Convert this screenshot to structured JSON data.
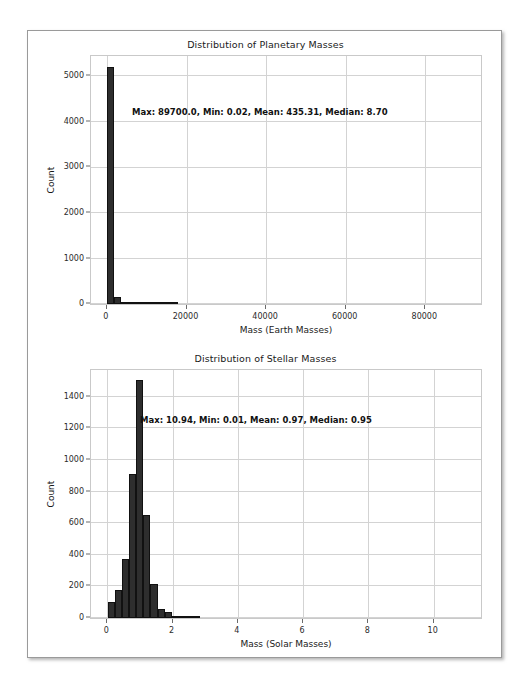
{
  "page": {
    "background": "#ffffff",
    "frame_border_color": "#9a9a9a"
  },
  "chart_data": [
    {
      "id": "planetary",
      "type": "bar",
      "title": "Distribution of Planetary Masses",
      "xlabel": "Mass (Earth Masses)",
      "ylabel": "Count",
      "xlim": [
        -4000,
        94000
      ],
      "ylim": [
        0,
        5450
      ],
      "xticks": [
        0,
        20000,
        40000,
        60000,
        80000
      ],
      "xtick_labels": [
        "0",
        "20000",
        "40000",
        "60000",
        "80000"
      ],
      "yticks": [
        0,
        1000,
        2000,
        3000,
        4000,
        5000
      ],
      "ytick_labels": [
        "0",
        "1000",
        "2000",
        "3000",
        "4000",
        "5000"
      ],
      "grid": true,
      "bar_color": "#2e2e2e",
      "bin_width": 1794,
      "bin_starts": [
        0,
        1794,
        3588,
        5382,
        7176,
        8970,
        10764,
        12558,
        14352,
        16146
      ],
      "values": [
        5200,
        150,
        40,
        12,
        5,
        3,
        2,
        1,
        1,
        1
      ],
      "annotation": "Max: 89700.0, Min: 0.02, Mean: 435.31, Median: 8.70",
      "stats": {
        "max": "89700.0",
        "min": "0.02",
        "mean": "435.31",
        "median": "8.70"
      }
    },
    {
      "id": "stellar",
      "type": "bar",
      "title": "Distribution of Stellar Masses",
      "xlabel": "Mass (Solar Masses)",
      "ylabel": "Count",
      "xlim": [
        -0.5,
        11.45
      ],
      "ylim": [
        0,
        1570
      ],
      "xticks": [
        0,
        2,
        4,
        6,
        8,
        10
      ],
      "xtick_labels": [
        "0",
        "2",
        "4",
        "6",
        "8",
        "10"
      ],
      "yticks": [
        0,
        200,
        400,
        600,
        800,
        1000,
        1200,
        1400
      ],
      "ytick_labels": [
        "0",
        "200",
        "400",
        "600",
        "800",
        "1000",
        "1200",
        "1400"
      ],
      "grid": true,
      "bar_color": "#2e2e2e",
      "bin_width": 0.2186,
      "bin_starts": [
        0.01,
        0.2286,
        0.4472,
        0.6658,
        0.8844,
        1.103,
        1.3216,
        1.5402,
        1.7588,
        1.9774,
        2.196,
        2.4146,
        2.6332
      ],
      "values": [
        100,
        175,
        375,
        910,
        1505,
        655,
        218,
        58,
        40,
        10,
        4,
        2,
        1
      ],
      "annotation": "Max: 10.94, Min: 0.01, Mean: 0.97, Median: 0.95",
      "stats": {
        "max": "10.94",
        "min": "0.01",
        "mean": "0.97",
        "median": "0.95"
      }
    }
  ]
}
